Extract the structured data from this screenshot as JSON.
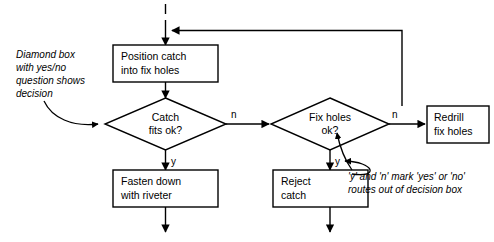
{
  "diagram": {
    "entry_marker": "l",
    "colors": {
      "stroke": "#000000",
      "fill": "#ffffff",
      "text": "#000000"
    },
    "process_boxes": [
      {
        "id": "position-catch",
        "lines": [
          "Position catch",
          "into fix holes"
        ]
      },
      {
        "id": "redrill-fix-holes",
        "lines": [
          "Redrill",
          "fix holes"
        ]
      },
      {
        "id": "fasten-down",
        "lines": [
          "Fasten down",
          "with riveter"
        ]
      },
      {
        "id": "reject-catch",
        "lines": [
          "Reject",
          "catch"
        ]
      }
    ],
    "decisions": [
      {
        "id": "catch-fits",
        "lines": [
          "Catch",
          "fits ok?"
        ],
        "yes_label": "y",
        "no_label": "n"
      },
      {
        "id": "fix-holes-ok",
        "lines": [
          "Fix holes",
          "ok?"
        ],
        "yes_label": "y",
        "no_label": "n"
      }
    ],
    "route_labels": {
      "catch_no": "n",
      "catch_yes": "y",
      "fix_no": "n",
      "fix_yes": "y"
    },
    "annotations": [
      {
        "id": "diamond-note",
        "lines": [
          "Diamond box",
          "with yes/no",
          "question shows",
          "decision"
        ]
      },
      {
        "id": "yn-note",
        "lines": [
          "'y' and 'n' mark 'yes' or 'no'",
          "routes out of decision box"
        ]
      }
    ]
  }
}
